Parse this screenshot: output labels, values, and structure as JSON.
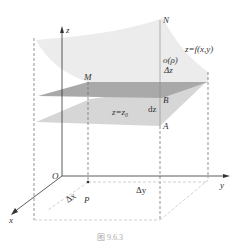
{
  "figure": {
    "caption": "图 9.6.3",
    "labels": {
      "z_axis": "z",
      "x_axis": "x",
      "y_axis": "y",
      "origin": "O",
      "N": "N",
      "M": "M",
      "B": "B",
      "A": "A",
      "P": "P",
      "surface": "z=f(x,y)",
      "rho": "o(ρ)",
      "delta_z": "Δz",
      "dz": "dz",
      "plane": "z=z₀",
      "delta_x": "Δx",
      "delta_y": "Δy"
    },
    "colors": {
      "surface": "#ececec",
      "tangent_plane": "#a9a9a9",
      "base_plane": "#d4d4d4",
      "axis": "#333333",
      "dashed": "#666666"
    }
  }
}
